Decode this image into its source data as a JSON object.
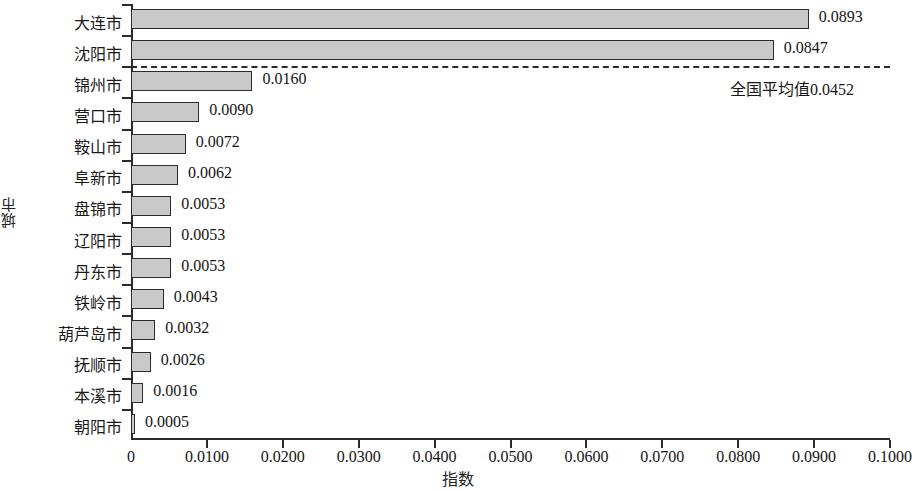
{
  "chart_data": {
    "type": "bar",
    "orientation": "horizontal",
    "title": "",
    "xlabel": "指数",
    "ylabel": "城市",
    "xlim": [
      0,
      0.1
    ],
    "grid": false,
    "legend": null,
    "categories": [
      "大连市",
      "沈阳市",
      "锦州市",
      "营口市",
      "鞍山市",
      "阜新市",
      "盘锦市",
      "辽阳市",
      "丹东市",
      "铁岭市",
      "葫芦岛市",
      "抚顺市",
      "本溪市",
      "朝阳市"
    ],
    "values": [
      0.0893,
      0.0847,
      0.016,
      0.009,
      0.0072,
      0.0062,
      0.0053,
      0.0053,
      0.0053,
      0.0043,
      0.0032,
      0.0026,
      0.0016,
      0.0005
    ],
    "value_labels": [
      "0.0893",
      "0.0847",
      "0.0160",
      "0.0090",
      "0.0072",
      "0.0062",
      "0.0053",
      "0.0053",
      "0.0053",
      "0.0043",
      "0.0032",
      "0.0026",
      "0.0016",
      "0.0005"
    ],
    "xticks": [
      0,
      0.01,
      0.02,
      0.03,
      0.04,
      0.05,
      0.06,
      0.07,
      0.08,
      0.09,
      0.1
    ],
    "xticklabels": [
      "0",
      "0.0100",
      "0.0200",
      "0.0300",
      "0.0400",
      "0.0500",
      "0.0600",
      "0.0700",
      "0.0800",
      "0.0900",
      "0.1000"
    ],
    "reference_line": {
      "value": 0.0452,
      "label": "全国平均值0.0452",
      "style": "dashed",
      "position_note": "drawn horizontally between 沈阳市 and 锦州市 rows"
    },
    "colors": {
      "bar_fill": "#c9c9c9",
      "bar_edge": "#2b2b2b",
      "axis": "#2b2b2b",
      "text": "#1a1a1a",
      "background": "#ffffff"
    }
  }
}
